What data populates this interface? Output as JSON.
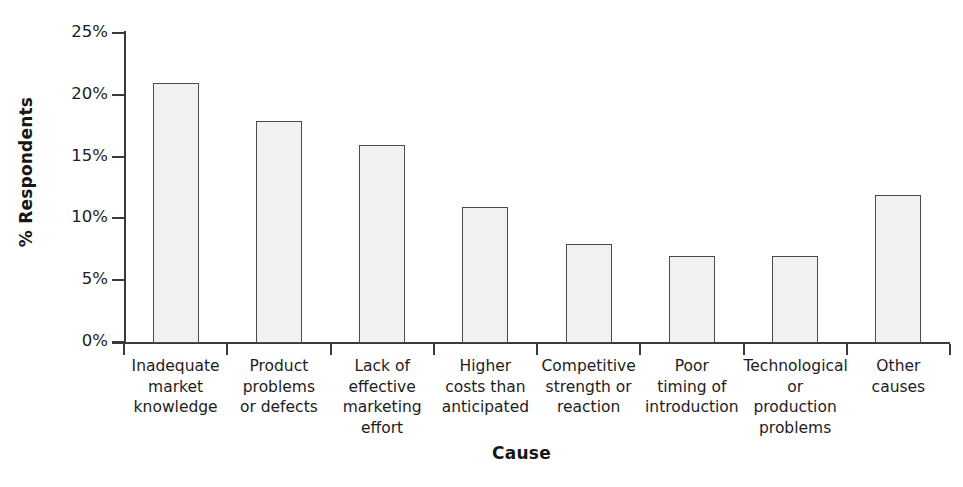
{
  "chart_data": {
    "type": "bar",
    "title": "",
    "xlabel": "Cause",
    "ylabel": "% Respondents",
    "categories": [
      "Inadequate market knowledge",
      "Product problems or defects",
      "Lack of effective marketing effort",
      "Higher costs than anticipated",
      "Competitive strength or reaction",
      "Poor timing of introduction",
      "Technological or production problems",
      "Other causes"
    ],
    "category_lines": [
      [
        "Inadequate",
        "market",
        "knowledge"
      ],
      [
        "Product",
        "problems",
        "or defects"
      ],
      [
        "Lack of",
        "effective",
        "marketing",
        "effort"
      ],
      [
        "Higher",
        "costs than",
        "anticipated"
      ],
      [
        "Competitive",
        "strength or",
        "reaction"
      ],
      [
        "Poor",
        "timing of",
        "introduction"
      ],
      [
        "Technological",
        "or production",
        "problems"
      ],
      [
        "Other",
        "causes"
      ]
    ],
    "values": [
      21,
      18,
      16,
      11,
      8,
      7,
      7,
      12
    ],
    "ylim": [
      0,
      25
    ],
    "ytick_values": [
      0,
      5,
      10,
      15,
      20,
      25
    ],
    "ytick_labels": [
      "0%",
      "5%",
      "10%",
      "15%",
      "20%",
      "25%"
    ],
    "grid": false,
    "legend": false,
    "bar_fill_color": "#f1f1f1",
    "bar_border_color": "#4a4a4a",
    "axis_color": "#3a3a3a",
    "text_color": "#1d1d1d",
    "background_color": "#ffffff"
  }
}
